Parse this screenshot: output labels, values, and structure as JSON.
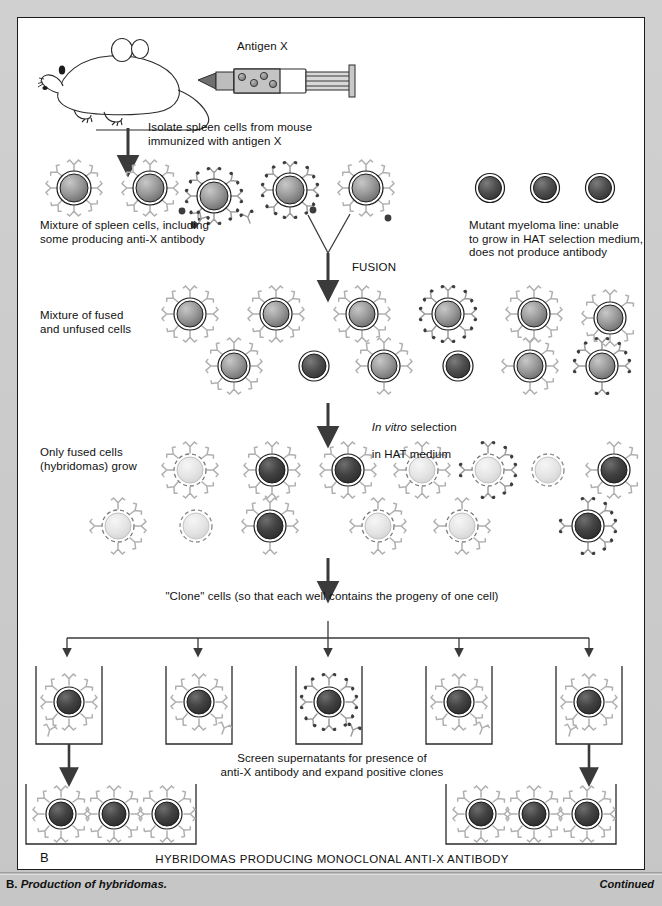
{
  "figure": {
    "panel_letter": "B",
    "bottom_title": "HYBRIDOMAS PRODUCING MONOCLONAL ANTI-X ANTIBODY",
    "caption_prefix": "B.",
    "caption_text": "Production of hybridomas.",
    "continued": "Continued"
  },
  "labels": {
    "antigen": "Antigen X",
    "isolate": "Isolate spleen cells from mouse\nimmunized with antigen X",
    "spleen_mixture": "Mixture of spleen cells, including\nsome producing anti-X antibody",
    "myeloma": "Mutant myeloma line: unable\nto grow in HAT selection medium,\ndoes not produce antibody",
    "fusion": "FUSION",
    "fused_unfused": "Mixture of fused\nand unfused cells",
    "selection_italic": "In vitro",
    "selection_rest": " selection",
    "selection_line2": "in HAT medium",
    "only_fused": "Only fused cells\n(hybridomas) grow",
    "clone": "\"Clone\" cells (so that each well contains the progeny of one cell)",
    "screen": "Screen supernatants for presence of\nanti-X antibody and expand positive clones"
  },
  "colors": {
    "page_background": "#c8c8c8",
    "panel_background": "#ffffff",
    "panel_border": "#1c1c1c",
    "text": "#111111",
    "arrow": "#3a3a3a",
    "spleen_cell": "#8d8d8d",
    "myeloma_cell": "#4a4a4a",
    "hybridoma_cell": "#3b3b3b",
    "dying_cell": "#e2e2e2",
    "antibody": "#b5b5b5",
    "antigen_dot": "#3a3a3a",
    "well_border": "#2a2a2a"
  },
  "diagram": {
    "spleen_row_cells": 5,
    "myeloma_cells": 3,
    "fused_row1_cells": 6,
    "fused_row2_cells": 6,
    "hybridoma_row1_cells": 6,
    "hybridoma_row2_cells": 6,
    "clone_wells": 5,
    "expanded_wells": 2,
    "cells_per_expanded_well": 3
  }
}
